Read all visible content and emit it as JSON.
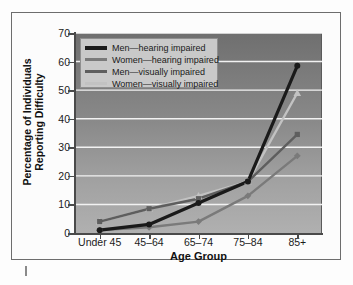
{
  "chart_data": {
    "type": "line",
    "title": "",
    "xlabel": "Age Group",
    "ylabel": "Percentage of Individuals Reporting Difficulty",
    "ylabel_line1": "Percentage of Individuals",
    "ylabel_line2": "Reporting Difficulty",
    "categories": [
      "Under 45",
      "45–64",
      "65–74",
      "75–84",
      "85+"
    ],
    "ylim": [
      0,
      70
    ],
    "yticks": [
      0,
      10,
      20,
      30,
      40,
      50,
      60,
      70
    ],
    "grid": "horizontal",
    "legend_position": "upper-left-inside",
    "series": [
      {
        "name": "Men—hearing impaired",
        "color": "#1a1a1a",
        "marker": "circle",
        "values": [
          1,
          3,
          10.5,
          18,
          58.5
        ]
      },
      {
        "name": "Women—hearing impaired",
        "color": "#7a7a7a",
        "marker": "diamond",
        "values": [
          1,
          2,
          4,
          13,
          27
        ]
      },
      {
        "name": "Men—visually impaired",
        "color": "#5e5e5e",
        "marker": "square",
        "values": [
          4,
          8.5,
          12,
          18,
          34.5
        ]
      },
      {
        "name": "Women—visually impaired",
        "color": "#c2c2c2",
        "marker": "triangle",
        "values": [
          4,
          8.5,
          13,
          18,
          49
        ]
      }
    ]
  },
  "legend": {
    "items": [
      "Men—hearing impaired",
      "Women—hearing impaired",
      "Men—visually impaired",
      "Women—visually impaired"
    ]
  },
  "colors": {
    "men_hearing": "#1a1a1a",
    "women_hearing": "#7a7a7a",
    "men_visual": "#5e5e5e",
    "women_visual": "#c2c2c2",
    "plot_bg_top": "#6f6f6f",
    "plot_bg_bottom": "#b0b0b0",
    "gridline": "#f2f2f2",
    "frame": "#6d6d6d"
  },
  "ytick_labels": [
    "70",
    "60",
    "50",
    "40",
    "30",
    "20",
    "10",
    "0"
  ]
}
